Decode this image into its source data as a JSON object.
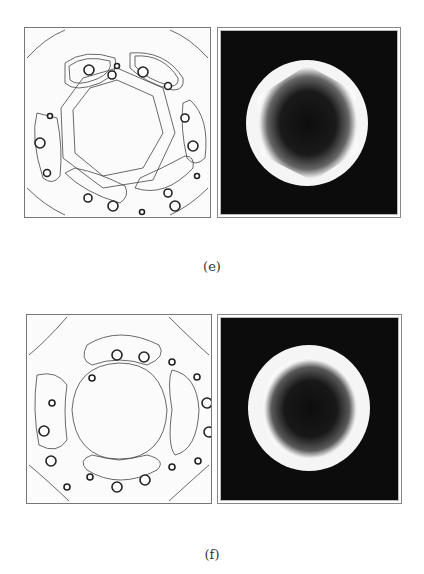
{
  "figures": [
    {
      "label": "(e)",
      "left_panel": {
        "type": "contour-plot",
        "symmetry": "hexagonal",
        "vortex_clusters": 6,
        "vortices_per_cluster": 3
      },
      "right_panel": {
        "type": "density-plot",
        "shape": "hexagonal ring"
      }
    },
    {
      "label": "(f)",
      "left_panel": {
        "type": "contour-plot",
        "symmetry": "square",
        "vortex_clusters": 4,
        "vortices_per_cluster": 4
      },
      "right_panel": {
        "type": "density-plot",
        "shape": "square-rounded ring"
      }
    }
  ]
}
